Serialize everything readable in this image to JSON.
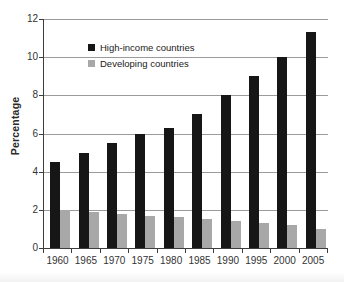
{
  "chart_data": {
    "type": "bar",
    "title": "",
    "xlabel": "",
    "ylabel": "Percentage",
    "categories": [
      "1960",
      "1965",
      "1970",
      "1975",
      "1980",
      "1985",
      "1990",
      "1995",
      "2000",
      "2005"
    ],
    "series": [
      {
        "name": "High-income countries",
        "color": "#161616",
        "values": [
          4.5,
          5.0,
          5.5,
          6.0,
          6.3,
          7.0,
          8.0,
          9.0,
          10.0,
          11.3
        ]
      },
      {
        "name": "Developing countries",
        "color": "#a8a8a8",
        "values": [
          2.0,
          1.9,
          1.8,
          1.7,
          1.6,
          1.5,
          1.4,
          1.3,
          1.2,
          1.0
        ]
      }
    ],
    "ylim": [
      0,
      12
    ],
    "yticks": [
      0,
      2,
      4,
      6,
      8,
      10,
      12
    ],
    "grid": "horizontal",
    "legend_position": "inside-top-left"
  },
  "colors": {
    "background": "#ffffff",
    "axis": "#3d3d3d",
    "gridline": "#9b9b9b",
    "tick_text": "#333333",
    "legend_text": "#1a1a1a"
  }
}
